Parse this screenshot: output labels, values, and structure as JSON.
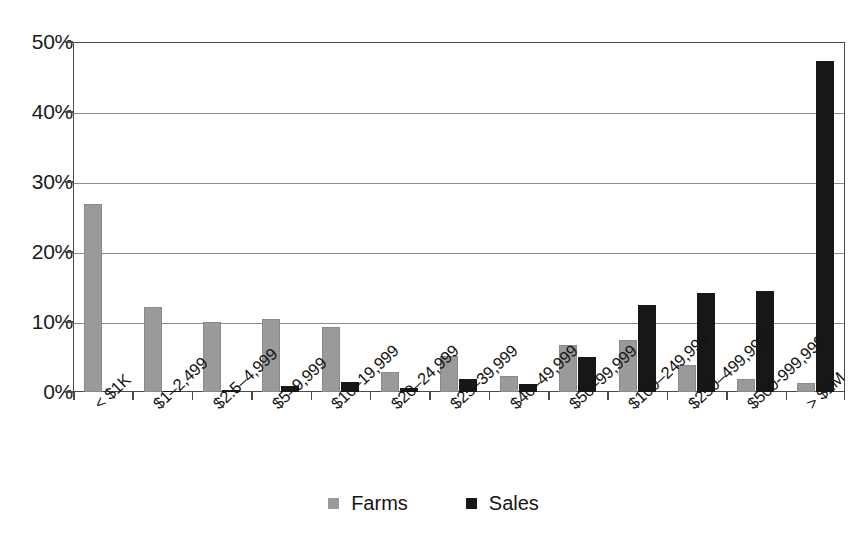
{
  "chart_data": {
    "type": "bar",
    "title": "",
    "subtitle": "",
    "xlabel": "",
    "ylabel": "",
    "ylim": [
      0,
      50
    ],
    "y_tick_labels": [
      "0%",
      "10%",
      "20%",
      "30%",
      "40%",
      "50%"
    ],
    "y_tick_values": [
      0,
      10,
      20,
      30,
      40,
      50
    ],
    "grid": true,
    "grid_axis": "y",
    "legend_position": "bottom-center",
    "categories": [
      "< $1K",
      "$1–2,499",
      "$2.5–4,999",
      "$5–9,999",
      "$10–19,999",
      "$20–24,999",
      "$25–39,999",
      "$40–49,999",
      "$50–99,999",
      "$100–249,999",
      "$250–499,999",
      "$500-999,999",
      "> $1M"
    ],
    "series": [
      {
        "name": "Farms",
        "color": "#9a9a9a",
        "values": [
          26.9,
          12.1,
          10.0,
          10.5,
          9.3,
          2.9,
          5.2,
          2.3,
          6.7,
          7.5,
          3.8,
          1.9,
          1.3
        ]
      },
      {
        "name": "Sales",
        "color": "#171717",
        "values": [
          0.0,
          0.2,
          0.3,
          0.8,
          1.4,
          0.6,
          1.8,
          1.1,
          5.0,
          12.5,
          14.1,
          14.4,
          47.3
        ]
      }
    ]
  },
  "legend": {
    "items": [
      {
        "label": "Farms",
        "swatch": "farms"
      },
      {
        "label": "Sales",
        "swatch": "sales"
      }
    ]
  }
}
